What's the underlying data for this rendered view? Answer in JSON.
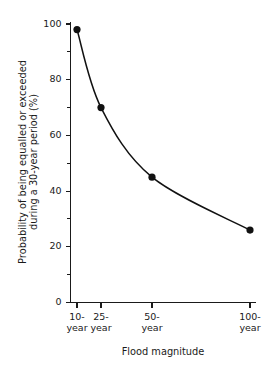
{
  "chart_data": {
    "type": "line",
    "title": "",
    "xlabel": "Flood magnitude",
    "ylabel": "Probability of being equalled or exceeded during a 30-year period (%)",
    "ylabel_line1": "Probability of being equalled or exceeded",
    "ylabel_line2": "during a 30-year period (%)",
    "categories": [
      "10-year",
      "25-year",
      "50-year",
      "100-year"
    ],
    "x": [
      10,
      25,
      50,
      100
    ],
    "values": [
      98,
      70,
      45,
      26
    ],
    "points": [
      {
        "category": "10-year",
        "x": 10,
        "y": 98
      },
      {
        "category": "25-year",
        "x": 25,
        "y": 70
      },
      {
        "category": "50-year",
        "x": 50,
        "y": 45
      },
      {
        "category": "100-year",
        "x": 100,
        "y": 26
      }
    ],
    "xlim": [
      0,
      112
    ],
    "ylim": [
      0,
      100
    ],
    "ytick_labels": [
      "0",
      "20",
      "40",
      "60",
      "80",
      "100"
    ],
    "ytick_values": [
      0,
      20,
      40,
      60,
      80,
      100
    ],
    "yminor_values": [
      10,
      30,
      50,
      70,
      90
    ],
    "xtick_values": [
      10,
      25,
      50,
      100
    ],
    "xtick_label_lines": [
      [
        "10-",
        "year"
      ],
      [
        "25-",
        "year"
      ],
      [
        "50-",
        "year"
      ],
      [
        "100-",
        "year"
      ]
    ],
    "grid": false,
    "legend": false,
    "legend_position": "none",
    "marker": "filled-circle",
    "line_color": "#111111",
    "marker_color": "#111111",
    "axis_color": "#1a1a1a",
    "background_color": "#ffffff"
  }
}
